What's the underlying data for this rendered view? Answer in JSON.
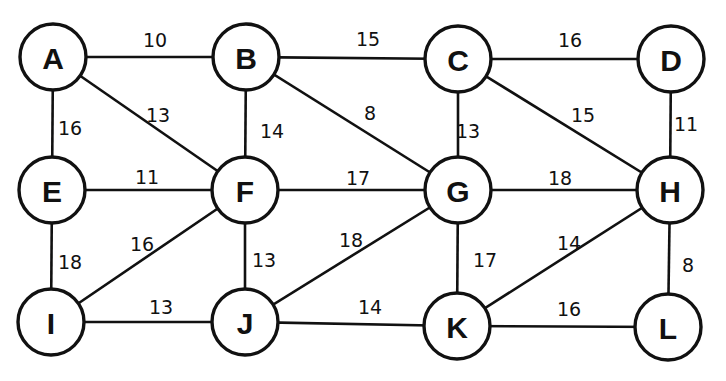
{
  "graph": {
    "colors": {
      "stroke": "#111111",
      "background": "#ffffff"
    },
    "node_radius": 33,
    "nodes": [
      {
        "id": "A",
        "label": "A",
        "x": 53,
        "y": 57
      },
      {
        "id": "B",
        "label": "B",
        "x": 246,
        "y": 57
      },
      {
        "id": "C",
        "label": "C",
        "x": 458,
        "y": 59
      },
      {
        "id": "D",
        "label": "D",
        "x": 671,
        "y": 59
      },
      {
        "id": "E",
        "label": "E",
        "x": 52,
        "y": 190
      },
      {
        "id": "F",
        "label": "F",
        "x": 245,
        "y": 190
      },
      {
        "id": "G",
        "label": "G",
        "x": 458,
        "y": 190
      },
      {
        "id": "H",
        "label": "H",
        "x": 670,
        "y": 190
      },
      {
        "id": "I",
        "label": "I",
        "x": 51,
        "y": 322
      },
      {
        "id": "J",
        "label": "J",
        "x": 245,
        "y": 322
      },
      {
        "id": "K",
        "label": "K",
        "x": 457,
        "y": 326
      },
      {
        "id": "L",
        "label": "L",
        "x": 668,
        "y": 327
      }
    ],
    "edges": [
      {
        "from": "A",
        "to": "B",
        "weight": "10",
        "lx": 155,
        "ly": 40
      },
      {
        "from": "B",
        "to": "C",
        "weight": "15",
        "lx": 368,
        "ly": 39
      },
      {
        "from": "C",
        "to": "D",
        "weight": "16",
        "lx": 570,
        "ly": 40
      },
      {
        "from": "A",
        "to": "E",
        "weight": "16",
        "lx": 70,
        "ly": 128
      },
      {
        "from": "A",
        "to": "F",
        "weight": "13",
        "lx": 158,
        "ly": 115
      },
      {
        "from": "B",
        "to": "F",
        "weight": "14",
        "lx": 272,
        "ly": 131
      },
      {
        "from": "B",
        "to": "G",
        "weight": "8",
        "lx": 370,
        "ly": 113
      },
      {
        "from": "C",
        "to": "G",
        "weight": "13",
        "lx": 468,
        "ly": 131
      },
      {
        "from": "C",
        "to": "H",
        "weight": "15",
        "lx": 583,
        "ly": 115
      },
      {
        "from": "D",
        "to": "H",
        "weight": "11",
        "lx": 686,
        "ly": 124
      },
      {
        "from": "E",
        "to": "F",
        "weight": "11",
        "lx": 147,
        "ly": 177
      },
      {
        "from": "F",
        "to": "G",
        "weight": "17",
        "lx": 358,
        "ly": 178
      },
      {
        "from": "G",
        "to": "H",
        "weight": "18",
        "lx": 560,
        "ly": 178
      },
      {
        "from": "E",
        "to": "I",
        "weight": "18",
        "lx": 70,
        "ly": 262
      },
      {
        "from": "F",
        "to": "I",
        "weight": "16",
        "lx": 142,
        "ly": 244
      },
      {
        "from": "F",
        "to": "J",
        "weight": "13",
        "lx": 264,
        "ly": 260
      },
      {
        "from": "G",
        "to": "J",
        "weight": "18",
        "lx": 351,
        "ly": 240
      },
      {
        "from": "G",
        "to": "K",
        "weight": "17",
        "lx": 485,
        "ly": 260
      },
      {
        "from": "H",
        "to": "K",
        "weight": "14",
        "lx": 569,
        "ly": 243
      },
      {
        "from": "H",
        "to": "L",
        "weight": "8",
        "lx": 688,
        "ly": 265
      },
      {
        "from": "I",
        "to": "J",
        "weight": "13",
        "lx": 161,
        "ly": 307
      },
      {
        "from": "J",
        "to": "K",
        "weight": "14",
        "lx": 370,
        "ly": 307
      },
      {
        "from": "K",
        "to": "L",
        "weight": "16",
        "lx": 569,
        "ly": 309
      }
    ]
  }
}
